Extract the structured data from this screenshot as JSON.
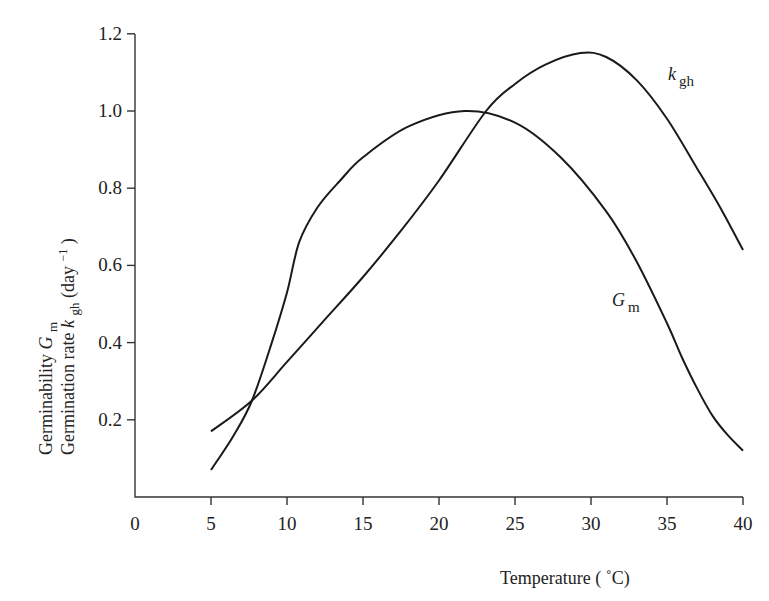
{
  "chart_data": {
    "type": "line",
    "title": "",
    "xlabel": "Temperature (°C)",
    "ylabel_lines": [
      "Germinability  G_m",
      "Germination rate  k_gh (day^-1)"
    ],
    "xlim": [
      0,
      40
    ],
    "ylim": [
      0,
      1.2
    ],
    "x_ticks": [
      0,
      5,
      10,
      15,
      20,
      25,
      30,
      35,
      40
    ],
    "y_ticks": [
      0.2,
      0.4,
      0.6,
      0.8,
      1.0,
      1.2
    ],
    "x_tick_labels": [
      "0",
      "5",
      "10",
      "15",
      "20",
      "25",
      "30",
      "35",
      "40"
    ],
    "y_tick_labels": [
      "0.2",
      "0.4",
      "0.6",
      "0.8",
      "1.0",
      "1.2"
    ],
    "grid": false,
    "legend": "inline labels",
    "series": [
      {
        "name": "k_gh",
        "label_main": "k",
        "label_sub": "gh",
        "x": [
          5,
          7.7,
          10,
          12.5,
          15,
          17.5,
          20,
          23.1,
          25,
          27,
          29.3,
          31,
          33,
          35,
          37,
          38.5,
          40
        ],
        "values": [
          0.17,
          0.25,
          0.35,
          0.46,
          0.57,
          0.69,
          0.82,
          1.0,
          1.07,
          1.12,
          1.15,
          1.14,
          1.08,
          0.98,
          0.85,
          0.75,
          0.64
        ]
      },
      {
        "name": "G_m",
        "label_main": "G",
        "label_sub": "m",
        "x": [
          5,
          6.5,
          7.7,
          9,
          10,
          10.8,
          12,
          13.5,
          15,
          18,
          21.7,
          25,
          28,
          31,
          33,
          35,
          36,
          37,
          38,
          39,
          40
        ],
        "values": [
          0.07,
          0.16,
          0.25,
          0.4,
          0.53,
          0.66,
          0.75,
          0.82,
          0.88,
          0.96,
          1.0,
          0.97,
          0.88,
          0.74,
          0.61,
          0.45,
          0.36,
          0.28,
          0.21,
          0.16,
          0.12
        ]
      }
    ]
  },
  "labels": {
    "xlabel": "Temperature ( ˚C)",
    "ylabel_line1_text": "Germinability ",
    "ylabel_line1_var": "G",
    "ylabel_line1_sub": "m",
    "ylabel_line2_text": "Germination rate ",
    "ylabel_line2_var": "k",
    "ylabel_line2_sub": "gh",
    "ylabel_line2_unit": " (day",
    "ylabel_line2_exp": "−1",
    "ylabel_line2_close": ")"
  }
}
